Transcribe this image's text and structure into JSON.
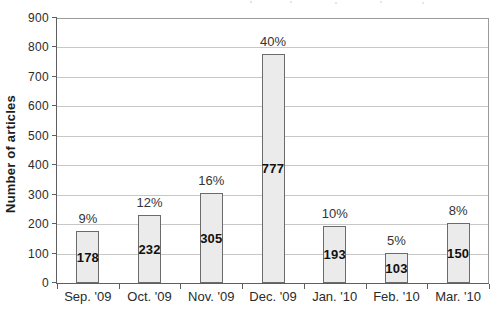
{
  "chart_data": {
    "type": "bar",
    "title": "",
    "ylabel": "Number of articles",
    "xlabel": "",
    "categories": [
      "Sep. '09",
      "Oct. '09",
      "Nov. '09",
      "Dec. '09",
      "Jan. '10",
      "Feb. '10",
      "Mar. '10"
    ],
    "values": [
      178,
      232,
      305,
      777,
      193,
      103,
      150
    ],
    "percent_labels": [
      "9%",
      "12%",
      "16%",
      "40%",
      "10%",
      "5%",
      "8%"
    ],
    "displayed_bar_values": [
      178,
      232,
      305,
      777,
      193,
      103,
      203
    ],
    "ylim": [
      0,
      900
    ],
    "ytick_step": 100,
    "ytick_labels": [
      "0",
      "100",
      "200",
      "300",
      "400",
      "500",
      "600",
      "700",
      "800",
      "900"
    ],
    "grid": "horizontal",
    "legend": "none",
    "colors": {
      "bar_fill": "#ebebeb",
      "bar_border": "#6b6b6b",
      "gridline": "#c7c7c7",
      "axis": "#5f5f5f",
      "plot_border": "#9b9b9b",
      "text": "#2b2b2b",
      "background": "#ffffff"
    }
  }
}
